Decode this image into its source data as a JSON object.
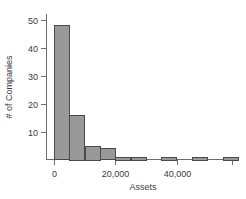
{
  "chart_data": {
    "type": "bar",
    "title": "",
    "subtitle": "",
    "xlabel": "Assets",
    "ylabel": "# of Companies",
    "grid": false,
    "legend": null,
    "xlim": [
      -2500,
      60000
    ],
    "ylim": [
      0,
      52
    ],
    "bin_width": 5000,
    "x_ticks": [
      0,
      20000,
      40000
    ],
    "x_tick_labels": [
      "0",
      "20,000",
      "40,000"
    ],
    "y_ticks": [
      10,
      20,
      30,
      40,
      50
    ],
    "y_tick_labels": [
      "10",
      "20",
      "30",
      "40",
      "50"
    ],
    "bar_color": "#999999",
    "bar_edge_color": "#4a4a4a",
    "axis_color": "#6e6e6e",
    "bins": [
      {
        "start": 0,
        "end": 5000,
        "value": 48
      },
      {
        "start": 5000,
        "end": 10000,
        "value": 16
      },
      {
        "start": 10000,
        "end": 15000,
        "value": 5
      },
      {
        "start": 15000,
        "end": 20000,
        "value": 4
      },
      {
        "start": 20000,
        "end": 25000,
        "value": 1
      },
      {
        "start": 25000,
        "end": 30000,
        "value": 1
      },
      {
        "start": 30000,
        "end": 35000,
        "value": 0
      },
      {
        "start": 35000,
        "end": 40000,
        "value": 1
      },
      {
        "start": 40000,
        "end": 45000,
        "value": 0
      },
      {
        "start": 45000,
        "end": 50000,
        "value": 1
      },
      {
        "start": 50000,
        "end": 55000,
        "value": 0
      },
      {
        "start": 55000,
        "end": 60000,
        "value": 1
      }
    ],
    "categories": [
      "0-5,000",
      "5,000-10,000",
      "10,000-15,000",
      "15,000-20,000",
      "20,000-25,000",
      "25,000-30,000",
      "30,000-35,000",
      "35,000-40,000",
      "40,000-45,000",
      "45,000-50,000",
      "50,000-55,000",
      "55,000-60,000"
    ],
    "values": [
      48,
      16,
      5,
      4,
      1,
      1,
      0,
      1,
      0,
      1,
      0,
      1
    ]
  }
}
